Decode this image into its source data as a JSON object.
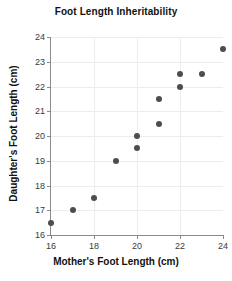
{
  "chart_data": {
    "type": "scatter",
    "title": "Foot Length Inheritability",
    "xlabel": "Mother's Foot Length (cm)",
    "ylabel": "Daughter's Foot Length (cm)",
    "xlim": [
      16,
      24
    ],
    "ylim": [
      16,
      24
    ],
    "xticks": [
      16,
      18,
      20,
      22,
      24
    ],
    "xtick_labels": [
      "16",
      "18",
      "20",
      "22",
      "24"
    ],
    "yticks": [
      16,
      17,
      18,
      19,
      20,
      21,
      22,
      23,
      24
    ],
    "ytick_labels": [
      "16",
      "17",
      "18",
      "19",
      "20",
      "21",
      "22",
      "23",
      "24"
    ],
    "grid": true,
    "grid_x_values": [
      18,
      20,
      22
    ],
    "grid_y_values": [
      17,
      18,
      19,
      20,
      21,
      22,
      23,
      24
    ],
    "legend": null,
    "marker_color": "#4d4d4d",
    "axis_color": "#8a8a8a",
    "grid_color": "#ededed",
    "background_color": "#ffffff",
    "x": [
      16,
      17,
      18,
      19,
      20,
      20,
      21,
      21,
      22,
      22,
      23,
      24
    ],
    "y": [
      16.5,
      17,
      17.5,
      19,
      19.5,
      20,
      20.5,
      21.5,
      22,
      22.5,
      22.5,
      23.5
    ],
    "points": [
      {
        "x": 16,
        "y": 16.5
      },
      {
        "x": 17,
        "y": 17
      },
      {
        "x": 18,
        "y": 17.5
      },
      {
        "x": 19,
        "y": 19
      },
      {
        "x": 20,
        "y": 19.5
      },
      {
        "x": 20,
        "y": 20
      },
      {
        "x": 21,
        "y": 20.5
      },
      {
        "x": 21,
        "y": 21.5
      },
      {
        "x": 22,
        "y": 22
      },
      {
        "x": 22,
        "y": 22.5
      },
      {
        "x": 23,
        "y": 22.5
      },
      {
        "x": 24,
        "y": 23.5
      }
    ]
  }
}
